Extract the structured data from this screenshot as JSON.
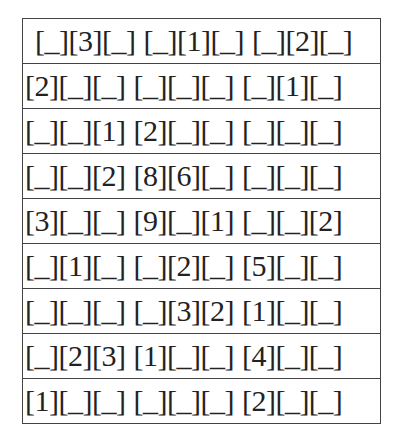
{
  "puzzle": {
    "rows": [
      [
        "[_][3][_]",
        "[_][1][_]",
        "[_][2][_]"
      ],
      [
        "[2][_][_]",
        "[_][_][_]",
        "[_][1][_]"
      ],
      [
        "[_][_][1]",
        "[2][_][_]",
        "[_][_][_]"
      ],
      [
        "[_][_][2]",
        "[8][6][_]",
        "[_][_][_]"
      ],
      [
        "[3][_][_]",
        "[9][_][1]",
        "[_][_][2]"
      ],
      [
        "[_][1][_]",
        "[_][2][_]",
        "[5][_][_]"
      ],
      [
        "[_][_][_]",
        "[_][3][2]",
        "[1][_][_]"
      ],
      [
        "[_][2][3]",
        "[1][_][_]",
        "[4][_][_]"
      ],
      [
        "[1][_][_]",
        "[_][_][_]",
        "[2][_][_]"
      ]
    ]
  }
}
